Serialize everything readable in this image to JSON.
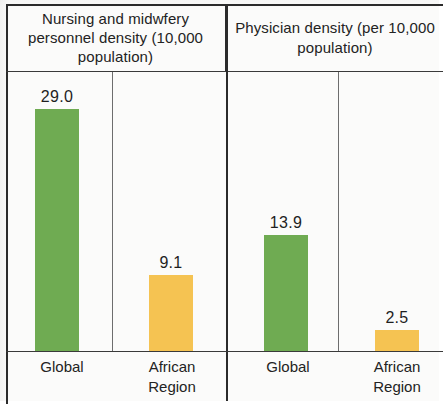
{
  "chart_data": {
    "type": "bar",
    "title": "",
    "grid": false,
    "legend": "none",
    "panels": [
      {
        "header": "Nursing and midwfery personnel density (10,000 population)",
        "categories": [
          "Global",
          "African Region"
        ],
        "values": [
          29.0,
          9.1
        ],
        "value_labels": [
          "29.0",
          "9.1"
        ],
        "colors": [
          "#6fab52",
          "#f5c352"
        ]
      },
      {
        "header": "Physician density (per 10,000 population)",
        "categories": [
          "Global",
          "African Region"
        ],
        "values": [
          13.9,
          2.5
        ],
        "value_labels": [
          "13.9",
          "2.5"
        ],
        "colors": [
          "#6fab52",
          "#f5c352"
        ]
      }
    ],
    "ylabel": "",
    "xlabel": "",
    "ylim": [
      0,
      29.0
    ],
    "series": [
      {
        "name": "Global",
        "values": [
          29.0,
          13.9
        ],
        "color": "#6fab52"
      },
      {
        "name": "African Region",
        "values": [
          9.1,
          2.5
        ],
        "color": "#f5c352"
      }
    ]
  },
  "table": {
    "headers": {
      "nursing": "Nursing and midwfery personnel density (10,000 population)",
      "physician": "Physician density (per 10,000 population)"
    },
    "bars": {
      "nursing_global": "29.0",
      "nursing_african": "9.1",
      "physician_global": "13.9",
      "physician_african": "2.5"
    },
    "labels": {
      "nursing_global": "Global",
      "nursing_african": "African Region",
      "physician_global": "Global",
      "physician_african": "African Region"
    }
  },
  "colors": {
    "green": "#6fab52",
    "gold": "#f5c352",
    "rule": "#2b2b2b"
  }
}
